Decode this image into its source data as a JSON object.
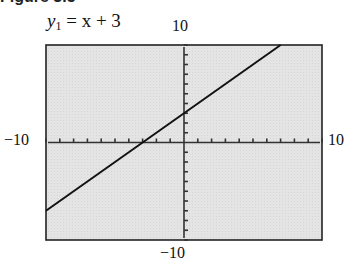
{
  "figure": {
    "heading_partial": "Figure 3.5"
  },
  "equation": {
    "y": "y",
    "sub": "1",
    "rest": " = x + 3"
  },
  "window_labels": {
    "ymax": "10",
    "ymin": "−10",
    "xmin": "−10",
    "xmax": "10"
  },
  "colors": {
    "screen_bg": "#e3e3e3",
    "frame": "#222222",
    "line": "#111111"
  },
  "chart_data": {
    "type": "line",
    "title": "y1 = x + 3",
    "xlabel": "",
    "ylabel": "",
    "xlim": [
      -10,
      10
    ],
    "ylim": [
      -10,
      10
    ],
    "xscl": 1,
    "yscl": 1,
    "grid": false,
    "series": [
      {
        "name": "y1 = x + 3",
        "x": [
          -10,
          7
        ],
        "y": [
          -7,
          10
        ]
      }
    ],
    "tick_labels": {
      "xmin": "−10",
      "xmax": "10",
      "ymin": "−10",
      "ymax": "10"
    }
  }
}
